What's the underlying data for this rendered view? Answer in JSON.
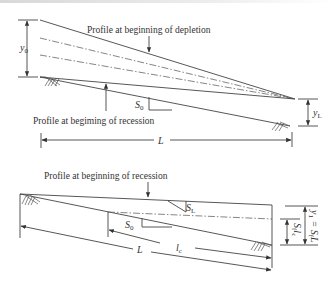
{
  "figure": {
    "top_panel": {
      "label_depletion": "Profile at beginning of depletion",
      "label_recession": "Profile at begiming of recession",
      "dim_y0": "y",
      "dim_y0_sub": "0",
      "dim_yL": "y",
      "dim_yL_sub": "L",
      "slope_S0": "S",
      "slope_S0_sub": "0",
      "length_L": "L"
    },
    "bottom_panel": {
      "label_recession": "Profile at beginning of recession",
      "slope_S0": "S",
      "slope_S0_sub": "0",
      "slope_SL": "S",
      "slope_SL_sub": "L",
      "length_L": "L",
      "length_lc": "l",
      "length_lc_sub": "c",
      "dim_SLc": "S",
      "dim_SLc_sub": "f",
      "dim_SLc_tail": "l",
      "dim_SLc_tail_sub": "c",
      "dim_y1": "y",
      "dim_y1_sub": "1",
      "dim_y1_eq": " = S",
      "dim_y1_eq_sub": "f",
      "dim_y1_tail": "L"
    }
  }
}
